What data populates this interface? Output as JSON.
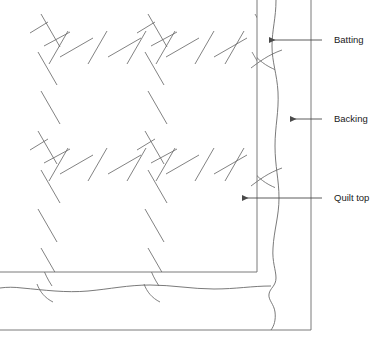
{
  "diagram": {
    "stroke_color": "#6b6b6b",
    "line_color": "#4a4a4a",
    "text_color": "#1a1a1a",
    "background": "#ffffff",
    "width": 383,
    "height": 345,
    "layers": [
      {
        "id": "quilt-top",
        "name": "Quilt top",
        "edge_kind": "straight-rectangle",
        "right_edge_x": 257,
        "bottom_edge_y": 272
      },
      {
        "id": "batting",
        "name": "Batting",
        "edge_kind": "wavy-line",
        "right_edge_x": 275,
        "bottom_edge_y": 286
      },
      {
        "id": "backing",
        "name": "Backing",
        "edge_kind": "straight-rectangle",
        "right_edge_x": 311,
        "bottom_edge_y": 330
      }
    ],
    "callouts": [
      {
        "id": "batting",
        "label": "Batting",
        "label_x": 334,
        "label_y": 40,
        "arrow_tip_x": 269,
        "arrow_tail_x": 322,
        "arrow_y": 40
      },
      {
        "id": "backing",
        "label": "Backing",
        "label_x": 334,
        "label_y": 119,
        "arrow_tip_x": 290,
        "arrow_tail_x": 322,
        "arrow_y": 119
      },
      {
        "id": "quilt-top",
        "label": "Quilt top",
        "label_x": 334,
        "label_y": 198,
        "arrow_tip_x": 242,
        "arrow_tail_x": 322,
        "arrow_y": 198
      }
    ],
    "quilting": {
      "description": "Crosshatch quilting stitch dashes in two diagonal directions",
      "dash_direction_a": "NW-SE",
      "dash_direction_b": "SW-NE"
    }
  }
}
